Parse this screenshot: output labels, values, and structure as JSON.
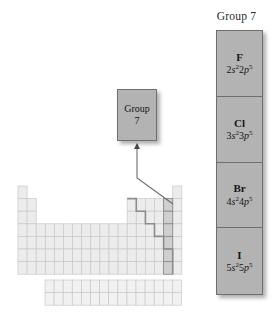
{
  "figure": {
    "kind": "periodic-table-group-highlight",
    "background": "#ffffff"
  },
  "callout": {
    "line1": "Group",
    "line2": "7",
    "fill": "#b3b3b3",
    "stroke": "#6f6f6f"
  },
  "panel": {
    "title": "Group 7",
    "fill": "#b3b3b3",
    "stroke": "#6f6f6f",
    "cells": [
      {
        "symbol": "F",
        "n1": "2",
        "orb1": "s",
        "sup1": "2",
        "n2": "2",
        "orb2": "p",
        "sup2": "5",
        "config": "2s22p5"
      },
      {
        "symbol": "Cl",
        "n1": "3",
        "orb1": "s",
        "sup1": "2",
        "n2": "3",
        "orb2": "p",
        "sup2": "5",
        "config": "3s23p5"
      },
      {
        "symbol": "Br",
        "n1": "4",
        "orb1": "s",
        "sup1": "2",
        "n2": "4",
        "orb2": "p",
        "sup2": "5",
        "config": "4s24p5"
      },
      {
        "symbol": "I",
        "n1": "5",
        "orb1": "s",
        "sup1": "2",
        "n2": "5",
        "orb2": "p",
        "sup2": "5",
        "config": "5s25p5"
      }
    ]
  },
  "table": {
    "cell_w": 9.1,
    "cell_h": 12.6,
    "origin_x": 18,
    "origin_y": 186,
    "grid_stroke": "#c9c9c9",
    "outer_stroke": "#bdbdbd",
    "cell_fill": "#ececec",
    "highlight_fill": "#cfcfcf",
    "highlight_stroke": "#8d8d8d",
    "staircase_stroke": "#8d8d8d",
    "highlight_group_index": 16,
    "rows": [
      {
        "row": 1,
        "spans": [
          [
            0,
            1
          ],
          [
            17,
            1
          ]
        ]
      },
      {
        "row": 2,
        "spans": [
          [
            0,
            2
          ],
          [
            12,
            6
          ]
        ]
      },
      {
        "row": 3,
        "spans": [
          [
            0,
            2
          ],
          [
            12,
            6
          ]
        ]
      },
      {
        "row": 4,
        "spans": [
          [
            0,
            18
          ]
        ]
      },
      {
        "row": 5,
        "spans": [
          [
            0,
            18
          ]
        ]
      },
      {
        "row": 6,
        "spans": [
          [
            0,
            18
          ]
        ]
      },
      {
        "row": 7,
        "spans": [
          [
            0,
            18
          ]
        ]
      }
    ],
    "fblock": {
      "origin_x": 45,
      "origin_y": 280,
      "cols": 15,
      "rows": 2
    }
  },
  "leader": {
    "stroke": "#6c6c6c",
    "arrow_to_x": 137,
    "arrow_to_y": 143,
    "elbow_x": 137,
    "elbow_y": 178,
    "tip_x": 173,
    "tip_y": 204
  }
}
